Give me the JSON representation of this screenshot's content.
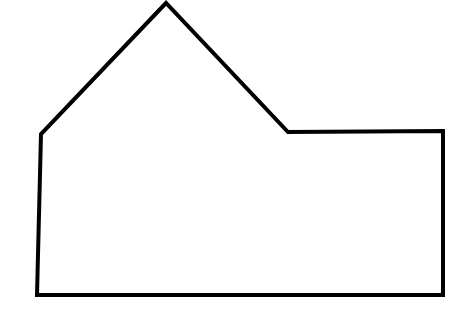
{
  "canvas": {
    "width": 465,
    "height": 318,
    "background_color": "#ffffff"
  },
  "figure": {
    "name": "house-shaped-polygon-outline",
    "stroke_color": "#000000",
    "fill_color": "#ffffff",
    "stroke_width": 4,
    "vertex_count": 6,
    "vertices": [
      {
        "label": "apex",
        "x": 166,
        "y": 3
      },
      {
        "label": "roof-left-eave",
        "x": 41,
        "y": 134
      },
      {
        "label": "bottom-left",
        "x": 37,
        "y": 295
      },
      {
        "label": "bottom-right",
        "x": 443,
        "y": 295
      },
      {
        "label": "top-right",
        "x": 443,
        "y": 131
      },
      {
        "label": "notch-inner-corner",
        "x": 288,
        "y": 132
      }
    ],
    "points_attr": "166,3 41,134 37,295 443,295 443,131 288,132",
    "edges": [
      {
        "label": "roof-left-slope",
        "from": "apex",
        "to": "roof-left-eave"
      },
      {
        "label": "left-wall",
        "from": "roof-left-eave",
        "to": "bottom-left"
      },
      {
        "label": "base",
        "from": "bottom-left",
        "to": "bottom-right"
      },
      {
        "label": "right-wall",
        "from": "bottom-right",
        "to": "top-right"
      },
      {
        "label": "flat-roof",
        "from": "top-right",
        "to": "notch-inner-corner"
      },
      {
        "label": "roof-right-slope",
        "from": "notch-inner-corner",
        "to": "apex"
      }
    ]
  }
}
